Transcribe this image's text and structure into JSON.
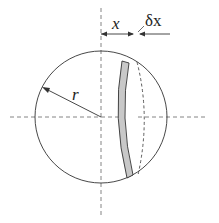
{
  "diagram": {
    "labels": {
      "radius": "r",
      "distance": "x",
      "thickness": "δx"
    },
    "colors": {
      "stroke": "#333333",
      "slab_fill": "#c8c8c8",
      "dash": "#555555"
    }
  }
}
